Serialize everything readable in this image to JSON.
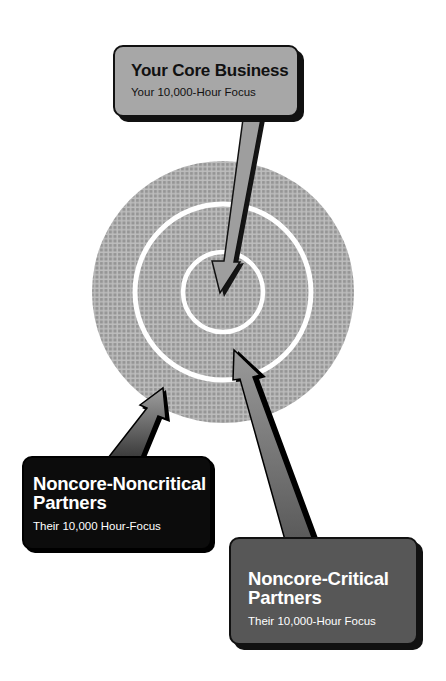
{
  "diagram": {
    "type": "target-with-callouts",
    "colors": {
      "background": "#ffffff",
      "target_fill": "#9a9a9a",
      "target_grid": "#bdbdbd",
      "ring_stroke": "#ffffff",
      "core_callout_fill": "#a7a7a7",
      "noncritical_callout_fill": "#0c0c0c",
      "critical_callout_fill": "#575757",
      "outline": "#111111"
    },
    "target": {
      "rings": [
        {
          "name": "inner-core",
          "label_ref": "core"
        },
        {
          "name": "middle-ring",
          "label_ref": "critical"
        },
        {
          "name": "outer-ring",
          "label_ref": "noncritical"
        }
      ]
    },
    "callouts": {
      "core": {
        "title": "Your Core Business",
        "subtitle": "Your 10,000-Hour Focus"
      },
      "noncritical": {
        "title_line1": "Noncore-Noncritical",
        "title_line2": "Partners",
        "subtitle": "Their 10,000 Hour-Focus"
      },
      "critical": {
        "title_line1": "Noncore-Critical",
        "title_line2": "Partners",
        "subtitle": "Their 10,000-Hour Focus"
      }
    }
  }
}
